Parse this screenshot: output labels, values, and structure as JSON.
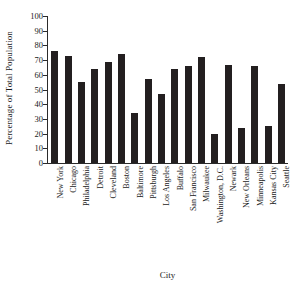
{
  "chart_data": {
    "type": "bar",
    "title": "",
    "xlabel": "City",
    "ylabel": "Percentage of Total Population",
    "ylim": [
      0,
      100
    ],
    "ytick_step": 10,
    "yticks": [
      0,
      10,
      20,
      30,
      40,
      50,
      60,
      70,
      80,
      90,
      100
    ],
    "grid": false,
    "legend": null,
    "bar_color": "#231f20",
    "axis_color": "#2b2b2b",
    "background_color": "#ffffff",
    "categories": [
      "New York",
      "Chicago",
      "Philadelphia",
      "Detroit",
      "Cleveland",
      "Boston",
      "Baltimore",
      "Pittsburgh",
      "Los Angeles",
      "Buffalo",
      "San Francisco",
      "Milwaukee",
      "Washington, D.C.",
      "Newark",
      "New Orleans",
      "Minneapolis",
      "Kansas City",
      "Seattle"
    ],
    "values": [
      76,
      73,
      55,
      64,
      69,
      74,
      34,
      57,
      47,
      64,
      66,
      72,
      20,
      67,
      24,
      66,
      25,
      54
    ]
  }
}
